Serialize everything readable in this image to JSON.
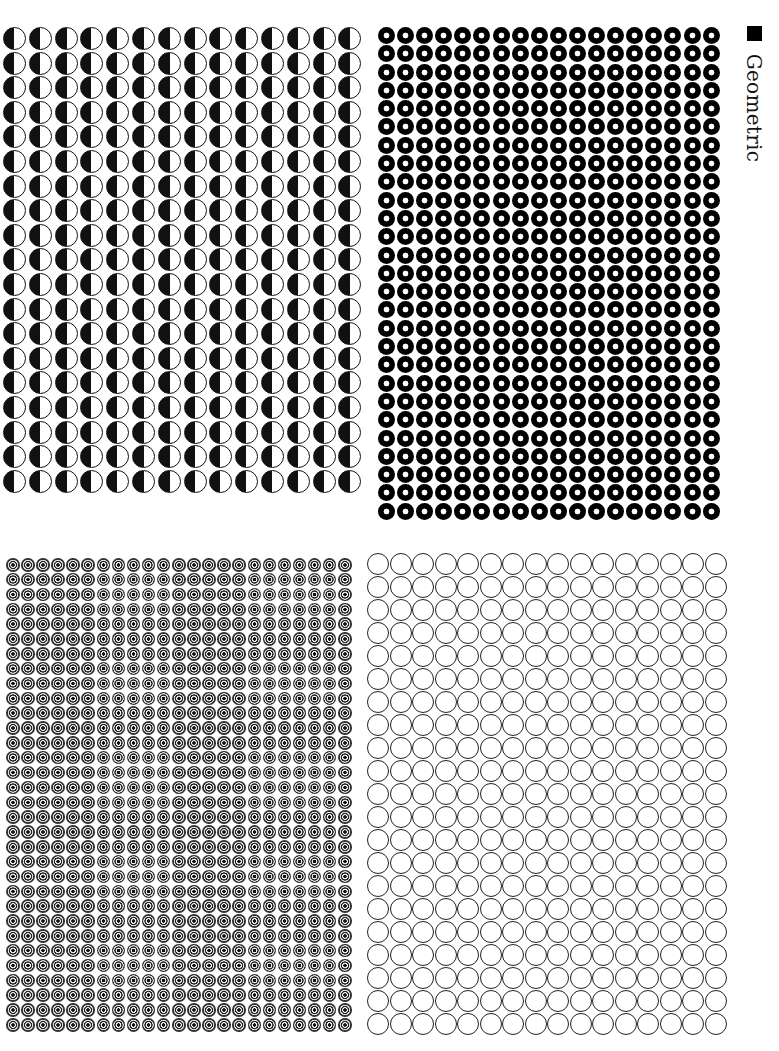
{
  "label": {
    "text": "Geometric",
    "marker": "black-square"
  },
  "panels": [
    {
      "id": "half",
      "pattern": "half-filled-circle",
      "columns": 14,
      "rows": 19,
      "colors": {
        "fill": "#111111",
        "background": "#ffffff"
      }
    },
    {
      "id": "donut",
      "pattern": "black-donut",
      "columns": 18,
      "rows": 27,
      "colors": {
        "fill": "#000000",
        "hole": "#ffffff"
      }
    },
    {
      "id": "target",
      "pattern": "concentric-target",
      "columns": 23,
      "rows": 32,
      "colors": {
        "fill": "#222222",
        "ring": "#eeeeee"
      }
    },
    {
      "id": "ring",
      "pattern": "outlined-circle",
      "columns": 16,
      "rows": 21,
      "colors": {
        "stroke": "#222222",
        "fill": "#ffffff"
      }
    }
  ]
}
